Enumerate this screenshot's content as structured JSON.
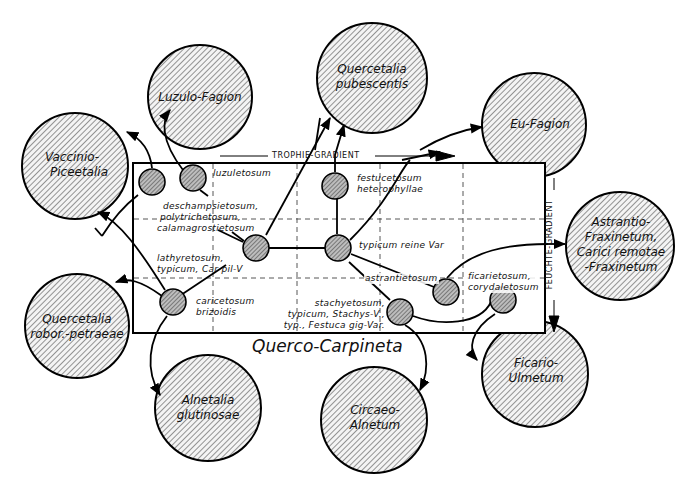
{
  "diagram": {
    "title": "Querco-Carpineta",
    "gradients": {
      "trophie": "TROPHIE-GRADIENT",
      "feuchte": "FEUCHTE-GRADIENT"
    },
    "big_circles": [
      {
        "id": "luzulo-fagion",
        "line1": "Luzulo-Fagion",
        "line2": ""
      },
      {
        "id": "quercetalia-pubescentis",
        "line1": "Quercetalia",
        "line2": "pubescentis"
      },
      {
        "id": "eu-fagion",
        "line1": "Eu-Fagion",
        "line2": ""
      },
      {
        "id": "vaccinio-piceetalia",
        "line1": "Vaccinio-",
        "line2": "Piceetalia"
      },
      {
        "id": "astrantio-fraxinetum",
        "line1": "Astrantio-",
        "line2": "Fraxinetum,",
        "line3": "Carici remotae",
        "line4": "-Fraxinetum"
      },
      {
        "id": "quercetalia-robor-petraeae",
        "line1": "Quercetalia",
        "line2": "robor.-petraeae"
      },
      {
        "id": "alnetalia-glutinosae",
        "line1": "Alnetalia",
        "line2": "glutinosae"
      },
      {
        "id": "circaeo-alnetum",
        "line1": "Circaeo-",
        "line2": "Alnetum"
      },
      {
        "id": "ficario-ulmetum",
        "line1": "Ficario-",
        "line2": "Ulmetum"
      }
    ],
    "subassociations": {
      "luzuletosum": "luzuletosum",
      "deschampsietosum": [
        "deschampsietosum,",
        "polytrichetosum,",
        "calamagrostietosum"
      ],
      "lathyretosum": [
        "lathyretosum,",
        "typicum, Car pil-V"
      ],
      "festucetosum": [
        "festucetosum",
        "heterophyllae"
      ],
      "typicum_reine": "typicum reine Var",
      "astrantietosum": "astrantietosum",
      "ficarietosum": [
        "ficarietosum,",
        "corydaletosum"
      ],
      "caricetosum": [
        "caricetosum",
        "brizoidis"
      ],
      "stachyetosum": [
        "stachyetosum,",
        "typicum, Stachys-V.,",
        "typ., Festuca gig-Var."
      ]
    }
  }
}
